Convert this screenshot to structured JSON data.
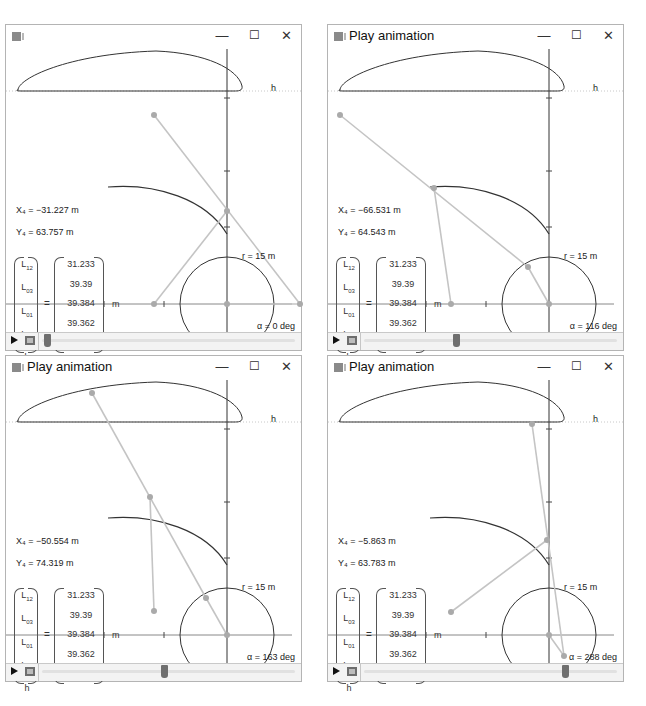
{
  "windows": [
    {
      "title": "",
      "x4": "X₄ = −31.227 m",
      "y4": "Y₄ = 63.757 m",
      "alpha": "α = 0 deg",
      "slider_pct": 1,
      "p_top": [
        148,
        66
      ],
      "p_mid": [
        221,
        162
      ],
      "p_base": [
        148,
        255
      ],
      "p_crank": [
        294,
        255
      ]
    },
    {
      "title": "Play animation",
      "x4": "X₄ = −66.531 m",
      "y4": "Y₄ = 64.543 m",
      "alpha": "α = 116 deg",
      "slider_pct": 36,
      "p_top": [
        12,
        66
      ],
      "p_mid": [
        106,
        139
      ],
      "p_base": [
        123,
        255
      ],
      "p_crank": [
        200,
        218
      ]
    },
    {
      "title": "Play animation",
      "x4": "X₄ = −50.554 m",
      "y4": "Y₄ = 74.319 m",
      "alpha": "α = 163 deg",
      "slider_pct": 48,
      "p_top": [
        86,
        13
      ],
      "p_mid": [
        144,
        117
      ],
      "p_base": [
        148,
        231
      ],
      "p_crank": [
        200,
        218
      ]
    },
    {
      "title": "Play animation",
      "x4": "X₄ = −5.863 m",
      "y4": "Y₄ = 63.783 m",
      "alpha": "α = 288 deg",
      "slider_pct": 80,
      "p_top": [
        204,
        44
      ],
      "p_mid": [
        219,
        160
      ],
      "p_base": [
        123,
        232
      ],
      "p_crank": [
        236,
        276
      ]
    }
  ],
  "common": {
    "h_label": "h",
    "r_label": "r = 15 m",
    "unit": "m",
    "equals": "=",
    "matrix_names": [
      "L",
      "L",
      "L",
      "L",
      "h"
    ],
    "matrix_subs": [
      "12",
      "03",
      "01",
      "04",
      ""
    ],
    "matrix_values": [
      "31.233",
      "39.39",
      "39.384",
      "39.362",
      "63.804"
    ],
    "buttons": {
      "minimize": "—",
      "maximize": "☐",
      "close": "✕"
    }
  }
}
